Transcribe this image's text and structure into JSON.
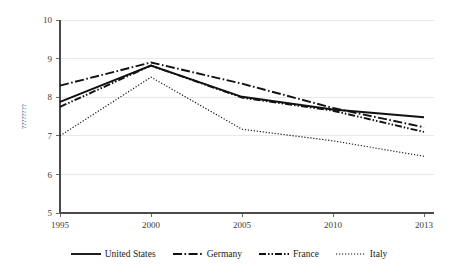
{
  "chart_data": {
    "type": "line",
    "title": "",
    "xlabel": "",
    "ylabel": "????????",
    "x": [
      1995,
      2000,
      2005,
      2010,
      2013
    ],
    "xtick_labels": [
      "1995",
      "2000",
      "2005",
      "2010",
      "2013"
    ],
    "ytick_labels": [
      "5",
      "6",
      "7",
      "8",
      "9",
      "10"
    ],
    "yticks": [
      5,
      6,
      7,
      8,
      9,
      10
    ],
    "ylim": [
      5,
      10
    ],
    "xlim": [
      1995,
      2013
    ],
    "grid": true,
    "grid_axis": "y",
    "legend_position": "bottom",
    "series": [
      {
        "name": "United States",
        "values": [
          7.88,
          8.82,
          8.01,
          7.68,
          7.48
        ],
        "style": "solid",
        "color": "#111111"
      },
      {
        "name": "Germany",
        "values": [
          8.3,
          8.9,
          8.35,
          7.72,
          7.22
        ],
        "style": "dash-dot",
        "color": "#111111"
      },
      {
        "name": "France",
        "values": [
          7.75,
          8.82,
          7.99,
          7.65,
          7.1
        ],
        "style": "dash-dot-dot",
        "color": "#111111"
      },
      {
        "name": "Italy",
        "values": [
          7.0,
          8.52,
          7.17,
          6.87,
          6.47
        ],
        "style": "dotted",
        "color": "#111111"
      }
    ]
  },
  "legend": {
    "items": [
      {
        "label": "United States",
        "style": "solid"
      },
      {
        "label": "Germany",
        "style": "dash-dot"
      },
      {
        "label": "France",
        "style": "dash-dot-dot"
      },
      {
        "label": "Italy",
        "style": "dotted"
      }
    ]
  }
}
